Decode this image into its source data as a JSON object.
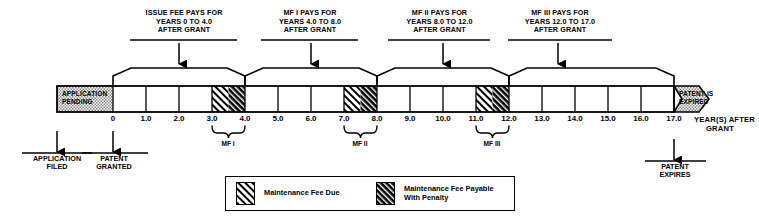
{
  "diagram": {
    "bar": {
      "pending_label_line1": "APPLICATION",
      "pending_label_line2": "PENDING",
      "expired_label_line1": "PATENT IS",
      "expired_label_line2": "EXPIRED"
    },
    "callouts": [
      {
        "id": "issue-fee",
        "line1": "ISSUE FEE PAYS FOR",
        "line2": "YEARS 0 TO 4.0",
        "line3": "AFTER GRANT",
        "span_start": 0,
        "span_end": 4.0,
        "arrow_at": 2.0
      },
      {
        "id": "mf-1",
        "line1": "MF I PAYS FOR",
        "line2": "YEARS 4.0 TO 8.0",
        "line3": "AFTER GRANT",
        "span_start": 4.0,
        "span_end": 8.0,
        "arrow_at": 6.0
      },
      {
        "id": "mf-2",
        "line1": "MF II PAYS FOR",
        "line2": "YEARS 8.0 TO 12.0",
        "line3": "AFTER GRANT",
        "span_start": 8.0,
        "span_end": 12.0,
        "arrow_at": 10.0
      },
      {
        "id": "mf-3",
        "line1": "MF III PAYS FOR",
        "line2": "YEARS 12.0 TO 17.0",
        "line3": "AFTER GRANT",
        "span_start": 12.0,
        "span_end": 17.0,
        "arrow_at": 14.5
      }
    ],
    "ticks": [
      "0",
      "1.0",
      "2.0",
      "3.0",
      "4.0",
      "5.0",
      "6.0",
      "7.0",
      "8.0",
      "9.0",
      "10.0",
      "11.0",
      "12.0",
      "13.0",
      "14.0",
      "15.0",
      "16.0",
      "17.0"
    ],
    "tick_values": [
      0,
      1,
      2,
      3,
      4,
      5,
      6,
      7,
      8,
      9,
      10,
      11,
      12,
      13,
      14,
      15,
      16,
      17
    ],
    "axis_label_line1": "YEAR(S)  AFTER",
    "axis_label_line2": "GRANT",
    "fee_windows": [
      {
        "label": "MF I",
        "due_start": 3.0,
        "due_end": 3.5,
        "penalty_start": 3.5,
        "penalty_end": 4.0
      },
      {
        "label": "MF II",
        "due_start": 7.0,
        "due_end": 7.5,
        "penalty_start": 7.5,
        "penalty_end": 8.0
      },
      {
        "label": "MF III",
        "due_start": 11.0,
        "due_end": 11.5,
        "penalty_start": 11.5,
        "penalty_end": 12.0
      }
    ],
    "events": [
      {
        "id": "application-filed",
        "line1": "APPLICATION",
        "line2": "FILED",
        "x_px": 57,
        "direction": "up"
      },
      {
        "id": "patent-granted",
        "line1": "PATENT",
        "line2": "GRANTED",
        "x_px": 113,
        "direction": "up"
      },
      {
        "id": "patent-expires",
        "line1": "PATENT",
        "line2": "EXPIRES",
        "x_px": 674,
        "direction": "up"
      }
    ],
    "legend": {
      "items": [
        {
          "id": "maintenance-fee-due",
          "line1": "Maintenance Fee Due",
          "line2": "",
          "pattern": "light-hatch"
        },
        {
          "id": "maintenance-fee-penalty",
          "line1": "Maintenance Fee Payable",
          "line2": "With Penalty",
          "pattern": "dark-hatch"
        }
      ]
    },
    "colors": {
      "ink": "#000000",
      "stipple_fill": "#b9b9b9",
      "paper": "#ffffff"
    }
  }
}
